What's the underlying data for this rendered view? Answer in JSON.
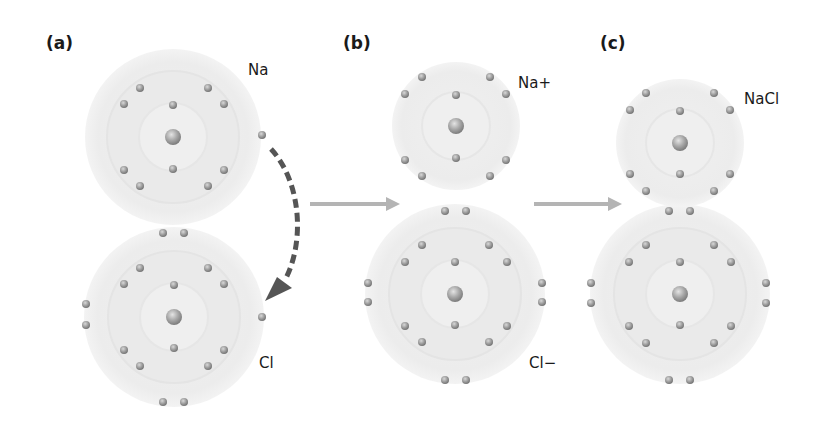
{
  "panels": [
    {
      "id": "a",
      "label": "(a)"
    },
    {
      "id": "b",
      "label": "(b)"
    },
    {
      "id": "c",
      "label": "(c)"
    }
  ],
  "atom_labels": {
    "a_top": "Na",
    "a_bottom": "Cl",
    "b_top": "Na+",
    "b_bottom": "Cl−",
    "c_top": "NaCl"
  },
  "colors": {
    "background": "#ffffff",
    "shell_fill": "#ececec",
    "shell_ring": "#e2e2e2",
    "electron": "#9a9a9a",
    "nucleus": "#a8a8a8",
    "transfer_arrow": "#555555",
    "step_arrow": "#b4b4b4",
    "text": "#1a1a1a"
  },
  "atoms": [
    {
      "name": "Na",
      "panel": "a",
      "cx": 173,
      "cy": 137,
      "outer_r": 88,
      "shells": 3,
      "electrons": [
        2,
        8,
        1
      ]
    },
    {
      "name": "Cl",
      "panel": "a",
      "cx": 174,
      "cy": 317,
      "outer_r": 90,
      "shells": 3,
      "electrons": [
        2,
        8,
        7
      ]
    },
    {
      "name": "Na+",
      "panel": "b",
      "cx": 456,
      "cy": 126,
      "outer_r": 64,
      "shells": 2,
      "electrons": [
        2,
        8
      ]
    },
    {
      "name": "Cl-",
      "panel": "b",
      "cx": 455,
      "cy": 294,
      "outer_r": 90,
      "shells": 3,
      "electrons": [
        2,
        8,
        8
      ]
    },
    {
      "name": "Na+",
      "panel": "c",
      "cx": 680,
      "cy": 143,
      "outer_r": 64,
      "shells": 2,
      "electrons": [
        2,
        8
      ]
    },
    {
      "name": "Cl-",
      "panel": "c",
      "cx": 680,
      "cy": 294,
      "outer_r": 90,
      "shells": 3,
      "electrons": [
        2,
        8,
        8
      ]
    }
  ],
  "arrows": [
    {
      "type": "dashed-curved",
      "meaning": "electron transfer Na to Cl",
      "from": [
        270,
        145
      ],
      "to": [
        268,
        298
      ]
    },
    {
      "type": "solid",
      "meaning": "step a to b",
      "from": [
        310,
        204
      ],
      "to": [
        400,
        204
      ]
    },
    {
      "type": "solid",
      "meaning": "step b to c",
      "from": [
        534,
        204
      ],
      "to": [
        622,
        204
      ]
    }
  ]
}
